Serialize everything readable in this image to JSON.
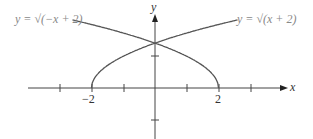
{
  "labels": {
    "left_curve": "y = √(−x + 2)",
    "right_curve": "y = √(x + 2)",
    "x_axis": "x",
    "y_axis": "y",
    "tick_neg2": "−2",
    "tick_pos2": "2"
  },
  "chart_data": {
    "type": "line",
    "series": [
      {
        "name": "y = sqrt(-x + 2)",
        "domain": [
          -5,
          2
        ]
      },
      {
        "name": "y = sqrt(x + 2)",
        "domain": [
          -2,
          5
        ]
      }
    ],
    "xlabel": "x",
    "ylabel": "y",
    "x_ticks_labeled": [
      -2,
      2
    ],
    "intersection": [
      0,
      1.414
    ]
  }
}
